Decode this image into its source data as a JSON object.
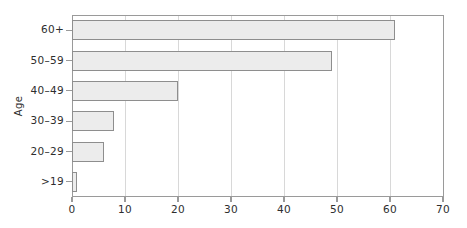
{
  "chart_data": {
    "type": "bar",
    "orientation": "horizontal",
    "title": "",
    "xlabel": "",
    "ylabel": "Age",
    "categories": [
      ">19",
      "20–29",
      "30–39",
      "40–49",
      "50–59",
      "60+"
    ],
    "values": [
      1,
      6,
      8,
      20,
      49,
      61
    ],
    "xlim": [
      0,
      70
    ],
    "xticks": [
      0,
      10,
      20,
      30,
      40,
      50,
      60,
      70
    ],
    "xtick_labels": [
      "0",
      "10",
      "20",
      "30",
      "40",
      "50",
      "60",
      "70"
    ],
    "grid": "vertical",
    "legend": "none",
    "bar_fill": "#ececec",
    "bar_edge": "#8e8e8e",
    "axis_color": "#9a9a9a",
    "grid_color": "#d8d8d8",
    "background": "#ffffff"
  },
  "axes": {
    "y_title": "Age"
  }
}
